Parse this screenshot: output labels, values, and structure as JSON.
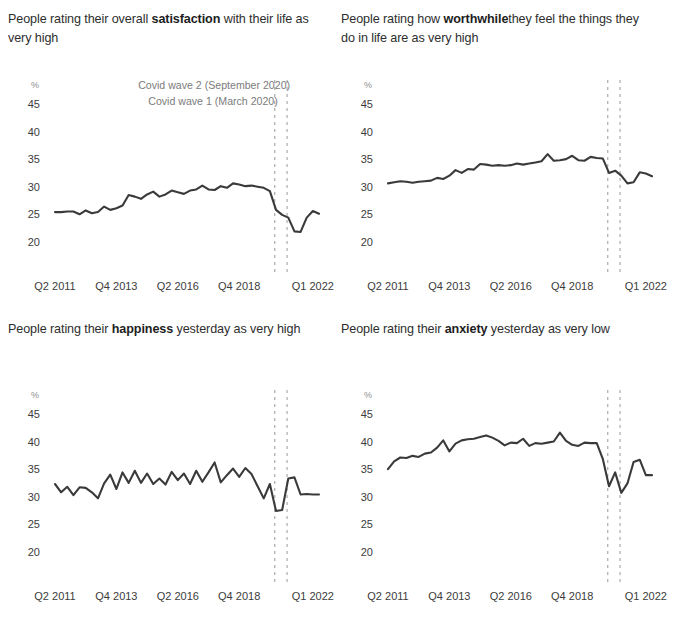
{
  "figure": {
    "yticks": [
      45,
      40,
      35,
      30,
      25,
      20
    ],
    "ylim": [
      18.0,
      47.0
    ],
    "unit_label": "%",
    "xticks": [
      "Q2 2011",
      "Q4 2013",
      "Q2 2016",
      "Q4 2018",
      "Q1 2022"
    ],
    "xtick_index": [
      0,
      10,
      20,
      30,
      42
    ],
    "n_points": 44,
    "line_color": "#3a3a3a",
    "grid": false,
    "legend": "none",
    "annotations": [
      {
        "name": "covid-wave-2",
        "label": "Covid wave 2 (September 2020)",
        "x_index": 37.8
      },
      {
        "name": "covid-wave-1",
        "label": "Covid wave 1 (March 2020)",
        "x_index": 35.8
      }
    ]
  },
  "chart_data": [
    {
      "type": "line",
      "name": "satisfaction",
      "title_plain": "People rating their overall satisfaction with their life as very high",
      "title_pre": "People rating their overall ",
      "title_bold": "satisfaction",
      "title_post": " with their life as very high",
      "xlabel": "",
      "ylabel": "%",
      "ylim": [
        18,
        47
      ],
      "categories": [
        "Q2 2011",
        "Q3 2011",
        "Q4 2011",
        "Q1 2012",
        "Q2 2012",
        "Q3 2012",
        "Q4 2012",
        "Q1 2013",
        "Q2 2013",
        "Q3 2013",
        "Q4 2013",
        "Q1 2014",
        "Q2 2014",
        "Q3 2014",
        "Q4 2014",
        "Q1 2015",
        "Q2 2015",
        "Q3 2015",
        "Q4 2015",
        "Q1 2016",
        "Q2 2016",
        "Q3 2016",
        "Q4 2016",
        "Q1 2017",
        "Q2 2017",
        "Q3 2017",
        "Q4 2017",
        "Q1 2018",
        "Q2 2018",
        "Q3 2018",
        "Q4 2018",
        "Q1 2019",
        "Q2 2019",
        "Q3 2019",
        "Q4 2019",
        "Q1 2020",
        "Q2 2020",
        "Q3 2020",
        "Q4 2020",
        "Q1 2021",
        "Q2 2021",
        "Q3 2021",
        "Q4 2021",
        "Q1 2022"
      ],
      "values": [
        25.6,
        25.6,
        25.7,
        25.7,
        25.2,
        25.9,
        25.4,
        25.6,
        26.6,
        26.0,
        26.3,
        26.8,
        28.7,
        28.4,
        28.0,
        28.8,
        29.3,
        28.4,
        28.8,
        29.5,
        29.2,
        28.9,
        29.5,
        29.7,
        30.4,
        29.7,
        29.6,
        30.3,
        30.0,
        30.8,
        30.6,
        30.3,
        30.4,
        30.2,
        30.0,
        29.4,
        26.0,
        25.1,
        24.6,
        22.1,
        22.0,
        24.6,
        25.8,
        25.3
      ]
    },
    {
      "type": "line",
      "name": "worthwhile",
      "title_plain": "People rating how worthwhilethey feel the things they do in life are as very high",
      "title_pre": "People rating how ",
      "title_bold": "worthwhile",
      "title_post": "they feel the things they do in life are as very high",
      "xlabel": "",
      "ylabel": "%",
      "ylim": [
        18,
        47
      ],
      "categories": [
        "Q2 2011",
        "Q3 2011",
        "Q4 2011",
        "Q1 2012",
        "Q2 2012",
        "Q3 2012",
        "Q4 2012",
        "Q1 2013",
        "Q2 2013",
        "Q3 2013",
        "Q4 2013",
        "Q1 2014",
        "Q2 2014",
        "Q3 2014",
        "Q4 2014",
        "Q1 2015",
        "Q2 2015",
        "Q3 2015",
        "Q4 2015",
        "Q1 2016",
        "Q2 2016",
        "Q3 2016",
        "Q4 2016",
        "Q1 2017",
        "Q2 2017",
        "Q3 2017",
        "Q4 2017",
        "Q1 2018",
        "Q2 2018",
        "Q3 2018",
        "Q4 2018",
        "Q1 2019",
        "Q2 2019",
        "Q3 2019",
        "Q4 2019",
        "Q1 2020",
        "Q2 2020",
        "Q3 2020",
        "Q4 2020",
        "Q1 2021",
        "Q2 2021",
        "Q3 2021",
        "Q4 2021",
        "Q1 2022"
      ],
      "values": [
        30.8,
        31.0,
        31.2,
        31.1,
        30.9,
        31.1,
        31.2,
        31.3,
        31.8,
        31.6,
        32.2,
        33.2,
        32.7,
        33.4,
        33.3,
        34.3,
        34.2,
        34.0,
        34.1,
        34.0,
        34.1,
        34.4,
        34.2,
        34.4,
        34.6,
        34.8,
        36.1,
        34.9,
        35.0,
        35.2,
        35.8,
        35.0,
        34.9,
        35.6,
        35.4,
        35.3,
        32.7,
        33.1,
        32.2,
        30.8,
        31.0,
        32.8,
        32.6,
        32.1
      ]
    },
    {
      "type": "line",
      "name": "happiness",
      "title_plain": "People rating their happiness yesterday as very high",
      "title_pre": "People rating their ",
      "title_bold": "happiness",
      "title_post": " yesterday as very high",
      "xlabel": "",
      "ylabel": "%",
      "ylim": [
        18,
        47
      ],
      "categories": [
        "Q2 2011",
        "Q3 2011",
        "Q4 2011",
        "Q1 2012",
        "Q2 2012",
        "Q3 2012",
        "Q4 2012",
        "Q1 2013",
        "Q2 2013",
        "Q3 2013",
        "Q4 2013",
        "Q1 2014",
        "Q2 2014",
        "Q3 2014",
        "Q4 2014",
        "Q1 2015",
        "Q2 2015",
        "Q3 2015",
        "Q4 2015",
        "Q1 2016",
        "Q2 2016",
        "Q3 2016",
        "Q4 2016",
        "Q1 2017",
        "Q2 2017",
        "Q3 2017",
        "Q4 2017",
        "Q1 2018",
        "Q2 2018",
        "Q3 2018",
        "Q4 2018",
        "Q1 2019",
        "Q2 2019",
        "Q3 2019",
        "Q4 2019",
        "Q1 2020",
        "Q2 2020",
        "Q3 2020",
        "Q4 2020",
        "Q1 2021",
        "Q2 2021",
        "Q3 2021",
        "Q4 2021",
        "Q1 2022"
      ],
      "values": [
        32.5,
        31.0,
        32.0,
        30.5,
        31.9,
        31.8,
        31.0,
        29.9,
        32.6,
        34.2,
        31.6,
        34.6,
        32.7,
        34.9,
        32.7,
        34.4,
        32.5,
        33.5,
        32.4,
        34.7,
        33.2,
        34.4,
        32.5,
        34.9,
        32.9,
        34.6,
        36.4,
        32.8,
        34.1,
        35.3,
        33.8,
        35.4,
        34.3,
        32.1,
        29.9,
        32.5,
        27.6,
        27.8,
        33.5,
        33.7,
        30.6,
        30.7,
        30.6,
        30.6
      ]
    },
    {
      "type": "line",
      "name": "anxiety",
      "title_plain": "People rating their anxiety yesterday as very low",
      "title_pre": "People rating their ",
      "title_bold": "anxiety",
      "title_post": " yesterday as very low",
      "xlabel": "",
      "ylabel": "%",
      "ylim": [
        18,
        47
      ],
      "categories": [
        "Q2 2011",
        "Q3 2011",
        "Q4 2011",
        "Q1 2012",
        "Q2 2012",
        "Q3 2012",
        "Q4 2012",
        "Q1 2013",
        "Q2 2013",
        "Q3 2013",
        "Q4 2013",
        "Q1 2014",
        "Q2 2014",
        "Q3 2014",
        "Q4 2014",
        "Q1 2015",
        "Q2 2015",
        "Q3 2015",
        "Q4 2015",
        "Q1 2016",
        "Q2 2016",
        "Q3 2016",
        "Q4 2016",
        "Q1 2017",
        "Q2 2017",
        "Q3 2017",
        "Q4 2017",
        "Q1 2018",
        "Q2 2018",
        "Q3 2018",
        "Q4 2018",
        "Q1 2019",
        "Q2 2019",
        "Q3 2019",
        "Q4 2019",
        "Q1 2020",
        "Q2 2020",
        "Q3 2020",
        "Q4 2020",
        "Q1 2021",
        "Q2 2021",
        "Q3 2021",
        "Q4 2021",
        "Q1 2022"
      ],
      "values": [
        35.2,
        36.6,
        37.3,
        37.2,
        37.6,
        37.4,
        38.0,
        38.2,
        39.1,
        40.4,
        38.4,
        39.8,
        40.4,
        40.6,
        40.7,
        41.0,
        41.3,
        40.9,
        40.3,
        39.5,
        40.0,
        39.9,
        40.7,
        39.4,
        39.9,
        39.8,
        40.0,
        40.2,
        41.8,
        40.3,
        39.6,
        39.4,
        40.0,
        39.9,
        39.9,
        37.0,
        32.1,
        34.6,
        30.9,
        32.6,
        36.5,
        36.9,
        34.1,
        34.1
      ]
    }
  ]
}
